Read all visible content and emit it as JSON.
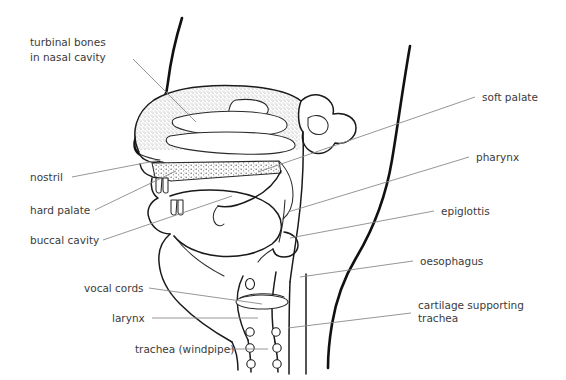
{
  "diagram": {
    "canvas": {
      "width": 566,
      "height": 380
    },
    "background_color": "#ffffff",
    "line_color": "#111111",
    "leader_color": "#8a8a8a",
    "text_color": "#3b3b3b",
    "shading_color": "#9a9a9a"
  },
  "labels_left": [
    {
      "id": "turbinal-bones",
      "line1": "turbinal bones",
      "line2": "in nasal cavity",
      "text_x": 30,
      "text_y": 46,
      "leader": "M 133 59 L 196 122"
    },
    {
      "id": "nostril",
      "line1": "nostril",
      "line2": "",
      "text_x": 30,
      "text_y": 181,
      "leader": "M 72 177 L 160 160"
    },
    {
      "id": "hard-palate",
      "line1": "hard palate",
      "line2": "",
      "text_x": 30,
      "text_y": 214,
      "leader": "M 95 210 L 176 171"
    },
    {
      "id": "buccal-cavity",
      "line1": "buccal cavity",
      "line2": "",
      "text_x": 30,
      "text_y": 244,
      "leader": "M 103 240 L 232 196"
    },
    {
      "id": "vocal-cords",
      "line1": "vocal cords",
      "line2": "",
      "text_x": 84,
      "text_y": 292,
      "leader": "M 149 288 L 262 304"
    },
    {
      "id": "larynx",
      "line1": "larynx",
      "line2": "",
      "text_x": 112,
      "text_y": 322,
      "leader": "M 152 318 L 258 318"
    },
    {
      "id": "trachea-windpipe",
      "line1": "trachea (windpipe)",
      "line2": "",
      "text_x": 135,
      "text_y": 353,
      "leader": "M 228 349 L 268 349"
    }
  ],
  "labels_right": [
    {
      "id": "soft-palate",
      "line1": "soft palate",
      "line2": "",
      "text_x": 482,
      "text_y": 101,
      "leader": "M 475 97 L 258 172"
    },
    {
      "id": "pharynx",
      "line1": "pharynx",
      "line2": "",
      "text_x": 476,
      "text_y": 161,
      "leader": "M 469 157 L 288 212"
    },
    {
      "id": "epiglottis",
      "line1": "epiglottis",
      "line2": "",
      "text_x": 441,
      "text_y": 215,
      "leader": "M 434 211 L 290 238"
    },
    {
      "id": "oesophagus",
      "line1": "oesophagus",
      "line2": "",
      "text_x": 420,
      "text_y": 265,
      "leader": "M 413 261 L 300 277"
    },
    {
      "id": "cartilage-supporting-trachea",
      "line1": "cartilage supporting",
      "line2": "trachea",
      "text_x": 418,
      "text_y": 309,
      "leader": "M 411 313 L 288 328"
    }
  ]
}
